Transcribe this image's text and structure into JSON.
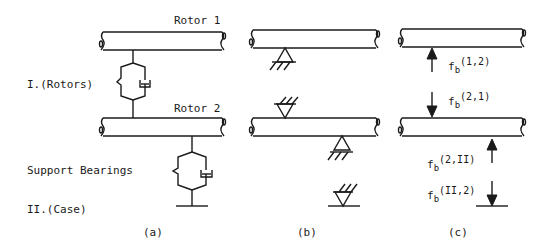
{
  "labels": {
    "rotor1": "Rotor 1",
    "rotor2": "Rotor 2",
    "rotors_level": "I.(Rotors)",
    "support_bearings": "Support Bearings",
    "case_level": "II.(Case)"
  },
  "panels": {
    "a": "(a)",
    "b": "(b)",
    "c": "(c)"
  },
  "forces": [
    {
      "base": "f",
      "sub": "b",
      "sup": "(1,2)"
    },
    {
      "base": "f",
      "sub": "b",
      "sup": "(2,1)"
    },
    {
      "base": "f",
      "sub": "b",
      "sup": "(2,II)"
    },
    {
      "base": "f",
      "sub": "b",
      "sup": "(II,2)"
    }
  ]
}
